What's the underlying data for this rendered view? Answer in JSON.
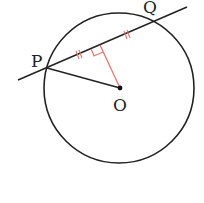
{
  "diagram": {
    "type": "geometry-circle-chord",
    "points": {
      "P": {
        "label": "P",
        "x": 47,
        "y": 68
      },
      "Q": {
        "label": "Q",
        "x": 153,
        "y": 22
      },
      "O": {
        "label": "O",
        "x": 120,
        "y": 88
      }
    },
    "circle": {
      "center": "O",
      "cx": 119,
      "cy": 88,
      "r": 75
    },
    "secant_line": {
      "through": [
        "P",
        "Q"
      ],
      "x1": 18,
      "y1": 80,
      "x2": 187,
      "y2": 7
    },
    "segments": [
      {
        "from": "P",
        "to": "O",
        "color": "#222222"
      },
      {
        "from": "O",
        "to": "M",
        "color": "#e8766e",
        "note": "perpendicular from O to chord PQ"
      }
    ],
    "foot_M": {
      "x": 100,
      "y": 45
    },
    "markers": {
      "right_angle": {
        "at": "M",
        "color": "#e8766e"
      },
      "equal_ticks": {
        "count_each": 2,
        "color": "#e8766e",
        "meaning": "PM = MQ"
      }
    },
    "colors": {
      "stroke": "#222222",
      "accent": "#e8766e",
      "background": "#ffffff"
    }
  }
}
